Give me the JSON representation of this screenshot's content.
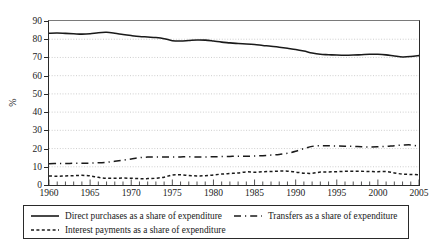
{
  "chart_data": {
    "type": "line",
    "title": "",
    "xlabel": "",
    "ylabel": "%",
    "xlim": [
      1960,
      2005
    ],
    "ylim": [
      0,
      90
    ],
    "ytick_labels": [
      "90",
      "80",
      "70",
      "60",
      "50",
      "40",
      "30",
      "20",
      "10",
      "0"
    ],
    "ytick_values": [
      90,
      80,
      70,
      60,
      50,
      40,
      30,
      20,
      10,
      0
    ],
    "xtick_labels": [
      "1960",
      "1965",
      "1970",
      "1975",
      "1980",
      "1985",
      "1990",
      "1995",
      "2000",
      "2005"
    ],
    "xtick_values": [
      1960,
      1965,
      1970,
      1975,
      1980,
      1985,
      1990,
      1995,
      2000,
      2005
    ],
    "minor_xticks_interval": 1,
    "grid": "horizontal-dotted",
    "legend_position": "below-plot",
    "x": [
      1960,
      1961,
      1962,
      1963,
      1964,
      1965,
      1966,
      1967,
      1968,
      1969,
      1970,
      1971,
      1972,
      1973,
      1974,
      1975,
      1976,
      1977,
      1978,
      1979,
      1980,
      1981,
      1982,
      1983,
      1984,
      1985,
      1986,
      1987,
      1988,
      1989,
      1990,
      1991,
      1992,
      1993,
      1994,
      1995,
      1996,
      1997,
      1998,
      1999,
      2000,
      2001,
      2002,
      2003,
      2004,
      2005
    ],
    "series": [
      {
        "name": "Direct purchases as a share of expenditure",
        "style": "solid",
        "color": "#1a1a1a",
        "values": [
          83.3,
          83.4,
          83.2,
          83.0,
          82.8,
          83.0,
          83.6,
          83.8,
          83.3,
          82.6,
          82.0,
          81.5,
          81.2,
          80.9,
          80.3,
          79.2,
          79.0,
          79.3,
          79.6,
          79.5,
          79.0,
          78.4,
          78.0,
          77.6,
          77.4,
          77.1,
          76.6,
          76.2,
          75.6,
          75.0,
          74.4,
          73.5,
          72.4,
          71.7,
          71.5,
          71.3,
          71.2,
          71.3,
          71.5,
          71.7,
          71.7,
          71.4,
          70.8,
          70.3,
          70.5,
          71.0
        ]
      },
      {
        "name": "Transfers as a share of expenditure",
        "style": "dashed",
        "color": "#1a1a1a",
        "values": [
          11.7,
          11.8,
          11.8,
          11.9,
          11.9,
          12.0,
          12.2,
          12.5,
          13.0,
          13.6,
          14.3,
          15.0,
          15.3,
          15.4,
          15.4,
          15.3,
          15.4,
          15.5,
          15.4,
          15.4,
          15.5,
          15.6,
          15.7,
          15.8,
          15.8,
          15.9,
          16.1,
          16.4,
          16.8,
          17.4,
          18.5,
          20.0,
          21.2,
          21.6,
          21.5,
          21.4,
          21.3,
          21.2,
          21.0,
          20.9,
          21.0,
          21.2,
          21.6,
          21.9,
          22.0,
          21.3
        ]
      },
      {
        "name": "Interest payments as a share of expenditure",
        "style": "dotted",
        "color": "#1a1a1a",
        "values": [
          5.0,
          4.8,
          5.0,
          5.1,
          5.3,
          5.0,
          4.2,
          3.7,
          3.7,
          3.8,
          3.7,
          3.5,
          3.5,
          3.7,
          4.3,
          5.5,
          5.6,
          5.2,
          5.0,
          5.1,
          5.5,
          6.0,
          6.3,
          6.6,
          7.2,
          7.0,
          7.3,
          7.4,
          7.6,
          7.6,
          7.1,
          6.5,
          6.4,
          7.1,
          7.2,
          7.3,
          7.5,
          7.5,
          7.5,
          7.4,
          7.3,
          7.4,
          6.6,
          6.0,
          5.8,
          5.6
        ]
      }
    ]
  },
  "axis": {
    "y_title": "%"
  },
  "legend": {
    "entries": [
      {
        "key": "solid-line-key",
        "label": "Direct purchases as a share of expenditure"
      },
      {
        "key": "dashed-line-key",
        "label": "Transfers as a share of expenditure"
      },
      {
        "key": "dotted-line-key",
        "label": "Interest payments as a share of expenditure"
      }
    ]
  }
}
